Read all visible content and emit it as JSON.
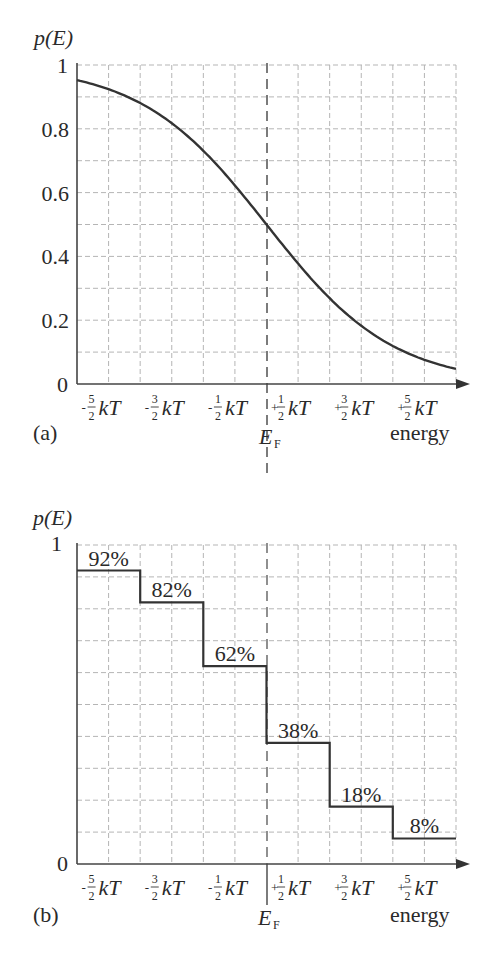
{
  "figure": {
    "panel_a": {
      "label": "(a)",
      "ylabel": "p(E)",
      "y_ticks": [
        "1",
        "0.8",
        "0.6",
        "0.4",
        "0.2",
        "0"
      ],
      "x_ticks": [
        {
          "sign": "-",
          "num": "5",
          "den": "2",
          "unit": "kT"
        },
        {
          "sign": "-",
          "num": "3",
          "den": "2",
          "unit": "kT"
        },
        {
          "sign": "-",
          "num": "1",
          "den": "2",
          "unit": "kT"
        },
        {
          "sign": "+",
          "num": "1",
          "den": "2",
          "unit": "kT"
        },
        {
          "sign": "+",
          "num": "3",
          "den": "2",
          "unit": "kT"
        },
        {
          "sign": "+",
          "num": "5",
          "den": "2",
          "unit": "kT"
        }
      ],
      "fermi_label": "E",
      "fermi_sub": "F",
      "xlabel": "energy"
    },
    "panel_b": {
      "label": "(b)",
      "ylabel": "p(E)",
      "y_ticks": [
        "1",
        "0"
      ],
      "step_labels": [
        "92%",
        "82%",
        "62%",
        "38%",
        "18%",
        "8%"
      ],
      "fermi_label": "E",
      "fermi_sub": "F",
      "xlabel": "energy"
    }
  },
  "chart_data": [
    {
      "type": "line",
      "title": "(a) Fermi-Dirac occupation probability",
      "xlabel": "energy",
      "ylabel": "p(E)",
      "x_tick_labels": [
        "-5/2 kT",
        "-3/2 kT",
        "-1/2 kT",
        "+1/2 kT",
        "+3/2 kT",
        "+5/2 kT"
      ],
      "y_tick_labels": [
        "0",
        "0.2",
        "0.4",
        "0.6",
        "0.8",
        "1"
      ],
      "x_unit": "kT (relative to E_F)",
      "x": [
        -3,
        -2.5,
        -2,
        -1.5,
        -1,
        -0.5,
        0,
        0.5,
        1,
        1.5,
        2,
        2.5,
        3
      ],
      "y": [
        0.95,
        0.92,
        0.88,
        0.82,
        0.73,
        0.62,
        0.5,
        0.38,
        0.27,
        0.18,
        0.12,
        0.08,
        0.05
      ],
      "xlim": [
        -3,
        3
      ],
      "ylim": [
        0,
        1
      ],
      "grid": true,
      "annotations": [
        "E_F dashed vertical line at x=0"
      ]
    },
    {
      "type": "bar",
      "title": "(b) Step approximation",
      "xlabel": "energy",
      "ylabel": "p(E)",
      "categories": [
        "-5/2 kT",
        "-3/2 kT",
        "-1/2 kT",
        "+1/2 kT",
        "+3/2 kT",
        "+5/2 kT"
      ],
      "values": [
        0.92,
        0.82,
        0.62,
        0.38,
        0.18,
        0.08
      ],
      "data_labels": [
        "92%",
        "82%",
        "62%",
        "38%",
        "18%",
        "8%"
      ],
      "ylim": [
        0,
        1
      ],
      "grid": true,
      "annotations": [
        "E_F vertical line at center"
      ]
    }
  ]
}
